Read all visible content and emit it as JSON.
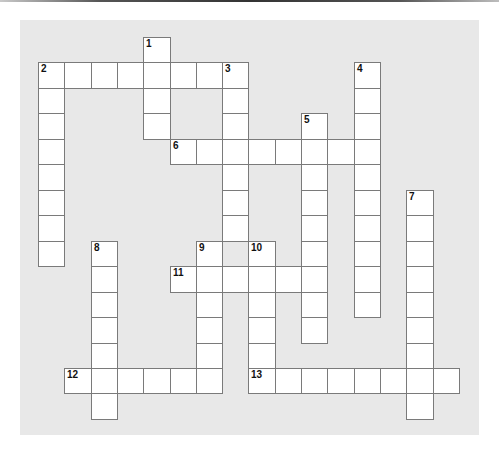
{
  "puzzle": {
    "type": "crossword",
    "grid": {
      "origin_x": 38,
      "origin_y": 37,
      "cell_w": 26.3,
      "cell_h": 25.46,
      "cols": 16,
      "rows": 15
    },
    "colors": {
      "board_background": "#e8e8e8",
      "cell_fill": "#ffffff",
      "cell_border": "#7a7a7a",
      "number_color": "#111111"
    },
    "words": [
      {
        "number": "1",
        "direction": "down",
        "row": 0,
        "col": 4,
        "length": 4
      },
      {
        "number": "2",
        "direction": "across",
        "row": 1,
        "col": 0,
        "length": 8
      },
      {
        "number": "2",
        "direction": "down",
        "row": 1,
        "col": 0,
        "length": 8
      },
      {
        "number": "3",
        "direction": "down",
        "row": 1,
        "col": 7,
        "length": 7
      },
      {
        "number": "4",
        "direction": "down",
        "row": 1,
        "col": 12,
        "length": 10
      },
      {
        "number": "5",
        "direction": "down",
        "row": 3,
        "col": 10,
        "length": 9
      },
      {
        "number": "6",
        "direction": "across",
        "row": 4,
        "col": 5,
        "length": 8
      },
      {
        "number": "7",
        "direction": "down",
        "row": 6,
        "col": 14,
        "length": 9
      },
      {
        "number": "8",
        "direction": "down",
        "row": 8,
        "col": 2,
        "length": 7
      },
      {
        "number": "9",
        "direction": "down",
        "row": 8,
        "col": 6,
        "length": 6
      },
      {
        "number": "10",
        "direction": "down",
        "row": 8,
        "col": 8,
        "length": 6
      },
      {
        "number": "11",
        "direction": "across",
        "row": 9,
        "col": 5,
        "length": 6
      },
      {
        "number": "12",
        "direction": "across",
        "row": 13,
        "col": 1,
        "length": 6
      },
      {
        "number": "13",
        "direction": "across",
        "row": 13,
        "col": 8,
        "length": 8
      }
    ]
  }
}
